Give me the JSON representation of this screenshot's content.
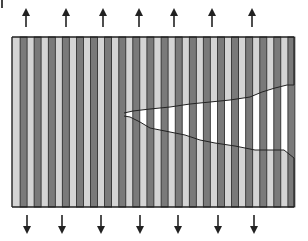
{
  "figure": {
    "colors": {
      "matrix": "#d4d4d4",
      "fiber": "#7a7a7a",
      "outline": "#222222",
      "crack": "#ffffff",
      "arrow": "#222222"
    },
    "frame": {
      "x0": 12,
      "y0": 37,
      "x1": 294,
      "y1": 207
    },
    "stripe_period": 14.1,
    "stripe_count": 20,
    "crack_upper": [
      [
        124,
        113
      ],
      [
        133,
        111
      ],
      [
        150,
        109
      ],
      [
        170,
        107
      ],
      [
        190,
        104
      ],
      [
        210,
        102
      ],
      [
        230,
        100
      ],
      [
        250,
        97
      ],
      [
        262,
        92
      ],
      [
        275,
        88
      ],
      [
        287,
        85
      ],
      [
        294,
        85
      ]
    ],
    "crack_lower": [
      [
        124,
        116
      ],
      [
        130,
        117
      ],
      [
        140,
        122
      ],
      [
        150,
        128
      ],
      [
        165,
        131
      ],
      [
        185,
        135
      ],
      [
        200,
        140
      ],
      [
        215,
        143
      ],
      [
        235,
        146
      ],
      [
        255,
        150
      ],
      [
        272,
        150
      ],
      [
        284,
        150
      ],
      [
        294,
        158
      ]
    ],
    "arrows_up": [
      26,
      66,
      103,
      139,
      174,
      212,
      252
    ],
    "arrows_down": [
      27,
      62,
      101,
      140,
      178,
      218,
      254
    ],
    "arrow_up_y": [
      9,
      27
    ],
    "arrow_down_y": [
      215,
      233
    ],
    "labels": {
      "arrow_up": "tensile load (up)",
      "arrow_down": "tensile load (down)"
    }
  }
}
